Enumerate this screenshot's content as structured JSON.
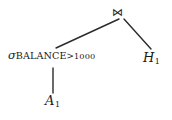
{
  "figure": {
    "type": "query-tree",
    "background_color": "#ffffff",
    "line_color": "#2b2b2b",
    "text_color": "#1a1a1a"
  },
  "nodes": {
    "join": {
      "label": "⋈",
      "icon": "join-bowtie-icon",
      "x": 122,
      "y": 14
    },
    "selection": {
      "operator": "σ",
      "attribute": "BALANCE",
      "comparison": ">",
      "value": "1000",
      "full_label": "σBALANCE>1000",
      "x": 53,
      "y": 58
    },
    "relation_a": {
      "symbol": "A",
      "subscript": "1",
      "label": "A1",
      "x": 53,
      "y": 100
    },
    "relation_h": {
      "symbol": "H",
      "subscript": "1",
      "label": "H1",
      "x": 152,
      "y": 58
    }
  },
  "edges": [
    {
      "name": "join-to-selection",
      "x1": 119,
      "y1": 19,
      "x2": 56,
      "y2": 48
    },
    {
      "name": "join-to-relation-h",
      "x1": 124,
      "y1": 19,
      "x2": 151,
      "y2": 49
    },
    {
      "name": "selection-to-relation-a",
      "x1": 53,
      "y1": 68,
      "x2": 53,
      "y2": 93
    }
  ]
}
